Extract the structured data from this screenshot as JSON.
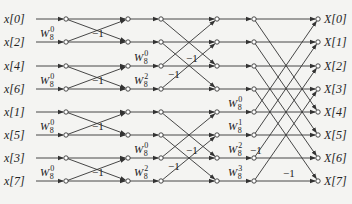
{
  "inputs": [
    "x[0]",
    "x[2]",
    "x[4]",
    "x[6]",
    "x[1]",
    "x[5]",
    "x[3]",
    "x[7]"
  ],
  "outputs": [
    "X[0]",
    "X[1]",
    "X[2]",
    "X[3]",
    "X[4]",
    "X[5]",
    "X[6]",
    "X[7]"
  ],
  "twiddle_base": "W",
  "twiddle_N": "8",
  "stage1_twiddles": [
    {
      "row": 1,
      "exp": "0"
    },
    {
      "row": 3,
      "exp": "0"
    },
    {
      "row": 5,
      "exp": "0"
    },
    {
      "row": 7,
      "exp": "0"
    }
  ],
  "stage2_twiddles": [
    {
      "row": 2,
      "exp": "0"
    },
    {
      "row": 3,
      "exp": "2"
    },
    {
      "row": 6,
      "exp": "0"
    },
    {
      "row": 7,
      "exp": "2"
    }
  ],
  "stage3_twiddles": [
    {
      "row": 4,
      "exp": "0"
    },
    {
      "row": 5,
      "exp": "1"
    },
    {
      "row": 6,
      "exp": "2"
    },
    {
      "row": 7,
      "exp": "3"
    }
  ],
  "minus_one": "−1",
  "colors": {
    "line": "#333333",
    "background": "#f4f4f2",
    "text": "#222222"
  }
}
